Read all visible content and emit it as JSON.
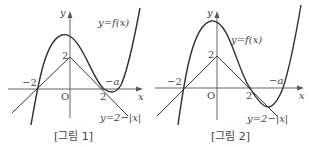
{
  "figures": [
    {
      "caption": "[그림 1]",
      "curve_label": "y=f(x)",
      "line_label": "y=2−|x|",
      "axis_x": "x",
      "axis_y": "y",
      "origin": "O",
      "tick_neg2": "−2",
      "tick_2x": "2",
      "tick_2y": "2",
      "root_label": "−a"
    },
    {
      "caption": "[그림 2]",
      "curve_label": "y=f(x)",
      "line_label": "y=2−|x|",
      "axis_x": "x",
      "axis_y": "y",
      "origin": "O",
      "tick_neg2": "−2",
      "tick_2x": "2",
      "tick_2y": "2",
      "root_label": "−a"
    }
  ],
  "colors": {
    "stroke": "#3a3a3a",
    "text": "#444444"
  }
}
